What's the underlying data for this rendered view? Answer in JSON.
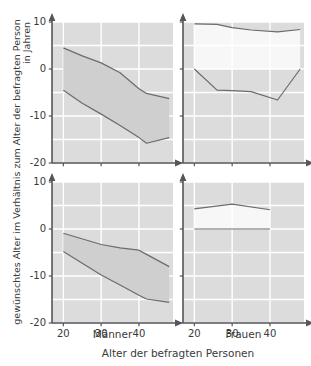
{
  "figure": {
    "y_axis_label_line1": "gewünschtes Alter im Verhältnis zum Alter der befragten Person",
    "y_axis_label_line2": "in Jahren",
    "x_axis_label": "Alter der befragten Personen",
    "panel_left_label": "Männer",
    "panel_right_label": "Frauen",
    "band_fill_color": "#cfcfcf",
    "plot_bg_color": "#dcdcdc",
    "gridline_color": "#ffffff",
    "axis_color": "#55555a",
    "curve_color": "#6b6b70",
    "text_color": "#3a3a3a"
  },
  "chart_data": {
    "type": "area",
    "title": "",
    "xlabel": "Alter der befragten Personen",
    "ylabel": "gewünschtes Alter im Verhältnis zum Alter der befragten Person in Jahren",
    "xlim": [
      17,
      49
    ],
    "ylim": [
      -20,
      10
    ],
    "xticks": [
      20,
      30,
      40
    ],
    "yticks": [
      10,
      0,
      -10,
      -20
    ],
    "xtick_labels": [
      "20",
      "30",
      "40"
    ],
    "ytick_labels": [
      "10",
      "0",
      "-10",
      "-20"
    ],
    "grid": true,
    "gridline_y_values": [
      10,
      5,
      0,
      -5,
      -10,
      -15,
      -20
    ],
    "gridline_x_values": [
      20,
      30,
      40
    ],
    "legend": "none",
    "panels": [
      {
        "id": "top-left",
        "row": 0,
        "col": 0,
        "group": "Männer",
        "row_label": "obere Reihe",
        "x": [
          20,
          25,
          30,
          35,
          40,
          42,
          48
        ],
        "upper": [
          4.5,
          2.8,
          1.3,
          -0.8,
          -4.2,
          -5.2,
          -6.3
        ],
        "lower": [
          -4.5,
          -7.3,
          -9.6,
          -12.0,
          -14.6,
          -15.8,
          -14.6
        ],
        "fill_between": true,
        "fill_sign": "between-upper-lower"
      },
      {
        "id": "top-right",
        "row": 0,
        "col": 1,
        "group": "Frauen",
        "row_label": "obere Reihe",
        "x": [
          20,
          26,
          30,
          35,
          42,
          48
        ],
        "upper": [
          9.6,
          9.5,
          8.8,
          8.3,
          7.9,
          8.4
        ],
        "lower": [
          0.0,
          -4.5,
          -4.6,
          -4.8,
          -6.6,
          0.0
        ],
        "fill_between": true,
        "fill_sign": "white-band-between-upper-and-zero"
      },
      {
        "id": "bottom-left",
        "row": 1,
        "col": 0,
        "group": "Männer",
        "row_label": "untere Reihe",
        "x": [
          20,
          30,
          35,
          40,
          42,
          48
        ],
        "upper": [
          -0.9,
          -3.3,
          -4.0,
          -4.5,
          -5.4,
          -8.0
        ],
        "lower": [
          -4.8,
          -9.8,
          -11.9,
          -14.1,
          -14.9,
          -15.6
        ],
        "fill_between": true,
        "fill_sign": "between-upper-lower"
      },
      {
        "id": "bottom-right",
        "row": 1,
        "col": 1,
        "group": "Frauen",
        "row_label": "untere Reihe",
        "x": [
          20,
          30,
          40
        ],
        "upper": [
          4.3,
          5.3,
          4.1
        ],
        "lower": [
          0.0,
          0.0,
          0.0
        ],
        "fill_between": true,
        "fill_sign": "white-band-between-upper-and-zero"
      }
    ]
  }
}
